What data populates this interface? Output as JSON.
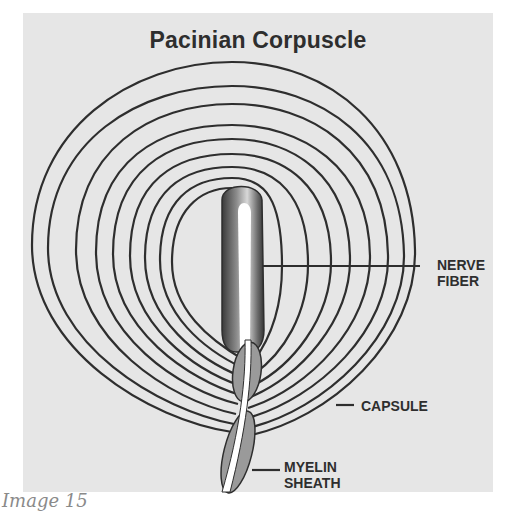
{
  "diagram": {
    "title": "Pacinian Corpuscle",
    "labels": {
      "nerve_fiber": [
        "NERVE",
        "FIBER"
      ],
      "capsule": "CAPSULE",
      "myelin_sheath": [
        "MYELIN",
        "SHEATH"
      ]
    },
    "caption": "Image 15"
  },
  "colors": {
    "panel_background": "#e6e6e6",
    "line": "#2e2e2e",
    "myelin_fill": "#9a9a9a",
    "caption": "#8a8a8a"
  }
}
